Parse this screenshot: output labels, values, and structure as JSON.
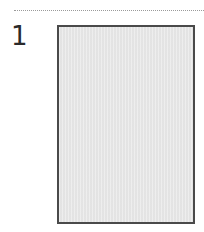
{
  "step": {
    "number": "1"
  },
  "colors": {
    "divider": "#9a9a9a",
    "number_text": "#2a2a2a",
    "box_border": "#4a4a4a",
    "box_fill": "#e8e8e8"
  }
}
